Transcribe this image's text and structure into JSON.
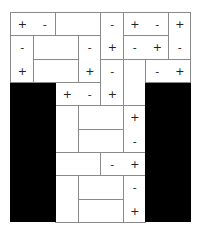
{
  "puzzle": {
    "type": "magnets",
    "cols": 8,
    "rows": 9,
    "cell_w": 22.5,
    "cell_h": 23.333,
    "colors": {
      "block": "#000000",
      "border": "#222222",
      "divider": "#8a8a8a",
      "cell": "#ffffff"
    },
    "blocked_regions": [
      {
        "c": 0,
        "r": 3,
        "w": 2,
        "h": 6
      },
      {
        "c": 6,
        "r": 3,
        "w": 2,
        "h": 6
      }
    ],
    "pieces": [
      {
        "c": 0,
        "r": 0,
        "w": 2,
        "h": 1
      },
      {
        "c": 2,
        "r": 0,
        "w": 2,
        "h": 1
      },
      {
        "c": 4,
        "r": 0,
        "w": 1,
        "h": 2
      },
      {
        "c": 5,
        "r": 0,
        "w": 2,
        "h": 1
      },
      {
        "c": 7,
        "r": 0,
        "w": 1,
        "h": 2
      },
      {
        "c": 0,
        "r": 1,
        "w": 1,
        "h": 2
      },
      {
        "c": 1,
        "r": 1,
        "w": 2,
        "h": 1
      },
      {
        "c": 3,
        "r": 1,
        "w": 1,
        "h": 2
      },
      {
        "c": 5,
        "r": 1,
        "w": 2,
        "h": 1
      },
      {
        "c": 1,
        "r": 2,
        "w": 2,
        "h": 1
      },
      {
        "c": 4,
        "r": 2,
        "w": 1,
        "h": 2
      },
      {
        "c": 5,
        "r": 2,
        "w": 1,
        "h": 2
      },
      {
        "c": 6,
        "r": 2,
        "w": 2,
        "h": 1
      },
      {
        "c": 2,
        "r": 3,
        "w": 2,
        "h": 1
      },
      {
        "c": 2,
        "r": 4,
        "w": 1,
        "h": 2
      },
      {
        "c": 3,
        "r": 4,
        "w": 2,
        "h": 1
      },
      {
        "c": 5,
        "r": 4,
        "w": 1,
        "h": 2
      },
      {
        "c": 3,
        "r": 5,
        "w": 2,
        "h": 1
      },
      {
        "c": 2,
        "r": 6,
        "w": 2,
        "h": 1
      },
      {
        "c": 4,
        "r": 6,
        "w": 2,
        "h": 1
      },
      {
        "c": 2,
        "r": 7,
        "w": 1,
        "h": 2
      },
      {
        "c": 3,
        "r": 7,
        "w": 2,
        "h": 1
      },
      {
        "c": 5,
        "r": 7,
        "w": 1,
        "h": 2
      },
      {
        "c": 3,
        "r": 8,
        "w": 2,
        "h": 1
      }
    ],
    "symbols": [
      {
        "c": 0,
        "r": 0,
        "s": "+"
      },
      {
        "c": 1,
        "r": 0,
        "s": "-"
      },
      {
        "c": 4,
        "r": 0,
        "s": "-"
      },
      {
        "c": 5,
        "r": 0,
        "s": "+"
      },
      {
        "c": 6,
        "r": 0,
        "s": "-"
      },
      {
        "c": 7,
        "r": 0,
        "s": "+"
      },
      {
        "c": 0,
        "r": 1,
        "s": "-"
      },
      {
        "c": 3,
        "r": 1,
        "s": "-"
      },
      {
        "c": 4,
        "r": 1,
        "s": "+"
      },
      {
        "c": 5,
        "r": 1,
        "s": "-"
      },
      {
        "c": 6,
        "r": 1,
        "s": "+"
      },
      {
        "c": 7,
        "r": 1,
        "s": "-"
      },
      {
        "c": 0,
        "r": 2,
        "s": "+"
      },
      {
        "c": 3,
        "r": 2,
        "s": "+"
      },
      {
        "c": 4,
        "r": 2,
        "s": "-"
      },
      {
        "c": 6,
        "r": 2,
        "s": "-"
      },
      {
        "c": 7,
        "r": 2,
        "s": "+"
      },
      {
        "c": 2,
        "r": 3,
        "s": "+"
      },
      {
        "c": 3,
        "r": 3,
        "s": "-"
      },
      {
        "c": 4,
        "r": 3,
        "s": "+"
      },
      {
        "c": 5,
        "r": 4,
        "s": "+"
      },
      {
        "c": 5,
        "r": 5,
        "s": "-"
      },
      {
        "c": 4,
        "r": 6,
        "s": "-"
      },
      {
        "c": 5,
        "r": 6,
        "s": "+"
      },
      {
        "c": 5,
        "r": 7,
        "s": "-"
      },
      {
        "c": 5,
        "r": 8,
        "s": "+"
      }
    ]
  }
}
